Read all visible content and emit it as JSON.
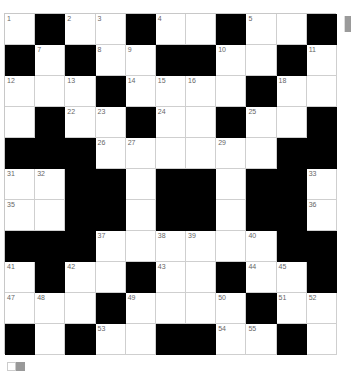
{
  "puzzle": {
    "rows": 11,
    "cols": 11,
    "grid": [
      [
        "1",
        "#",
        "2",
        "3",
        "#",
        "4",
        "",
        "#",
        "5",
        "",
        "#"
      ],
      [
        "#",
        "7",
        "#",
        "8",
        "9",
        "#",
        "#",
        "10",
        "",
        "#",
        "11"
      ],
      [
        "12",
        "",
        "13",
        "#",
        "14",
        "15",
        "16",
        "",
        "#",
        "18",
        ""
      ],
      [
        "",
        "#",
        "22",
        "23",
        "#",
        "24",
        "",
        "#",
        "25",
        "",
        "#"
      ],
      [
        "#",
        "#",
        "#",
        "26",
        "27",
        "",
        "",
        "29",
        "",
        "#",
        "#"
      ],
      [
        "31",
        "32",
        "#",
        "#",
        "",
        "#",
        "#",
        "",
        "#",
        "#",
        "33"
      ],
      [
        "35",
        "",
        "#",
        "#",
        "",
        "#",
        "#",
        "",
        "#",
        "#",
        "36"
      ],
      [
        "#",
        "#",
        "#",
        "37",
        "",
        "38",
        "39",
        "",
        "40",
        "#",
        "#"
      ],
      [
        "41",
        "#",
        "42",
        "",
        "#",
        "43",
        "",
        "#",
        "44",
        "45",
        "#"
      ],
      [
        "47",
        "48",
        "",
        "#",
        "49",
        "",
        "",
        "50",
        "#",
        "51",
        "52"
      ],
      [
        "#",
        "",
        "#",
        "53",
        "",
        "#",
        "#",
        "54",
        "55",
        "#",
        ""
      ]
    ]
  },
  "colors": {
    "block": "#000000",
    "cell": "#ffffff",
    "gridline": "#cfcfcf",
    "number": "#666666",
    "scroll_thumb": "#9a9a9a",
    "legend_white": "#ffffff",
    "legend_gray": "#999999"
  },
  "icons": {
    "scrollbar": "scrollbar-thumb",
    "legend": "color-legend-swatches"
  }
}
